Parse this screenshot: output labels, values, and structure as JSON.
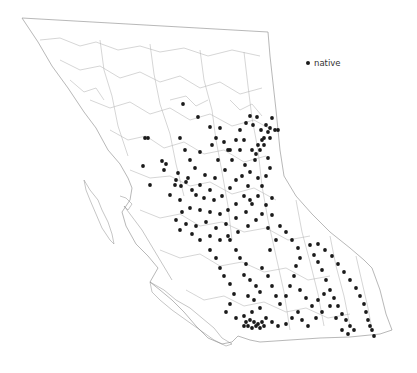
{
  "map": {
    "region": "British Columbia",
    "background": "#ffffff",
    "point_color": "#1a1a1a",
    "outline_color": "#9a9a9a",
    "river_color": "#b4b4b4"
  },
  "legend": {
    "items": [
      {
        "label": "native",
        "symbol": "filled-circle",
        "color": "#1a1a1a"
      }
    ]
  },
  "occurrences": {
    "category": "native",
    "points": [
      [
        183,
        104
      ],
      [
        198,
        117
      ],
      [
        210,
        127
      ],
      [
        180,
        138
      ],
      [
        145,
        138
      ],
      [
        148,
        138
      ],
      [
        228,
        150
      ],
      [
        143,
        166
      ],
      [
        162,
        161
      ],
      [
        164,
        170
      ],
      [
        166,
        164
      ],
      [
        150,
        185
      ],
      [
        178,
        173
      ],
      [
        185,
        150
      ],
      [
        190,
        160
      ],
      [
        195,
        168
      ],
      [
        200,
        152
      ],
      [
        212,
        145
      ],
      [
        218,
        160
      ],
      [
        205,
        175
      ],
      [
        188,
        178
      ],
      [
        175,
        185
      ],
      [
        170,
        195
      ],
      [
        180,
        200
      ],
      [
        192,
        190
      ],
      [
        200,
        185
      ],
      [
        210,
        190
      ],
      [
        215,
        178
      ],
      [
        225,
        170
      ],
      [
        232,
        160
      ],
      [
        240,
        150
      ],
      [
        245,
        165
      ],
      [
        250,
        172
      ],
      [
        255,
        160
      ],
      [
        260,
        150
      ],
      [
        262,
        140
      ],
      [
        268,
        132
      ],
      [
        270,
        128
      ],
      [
        275,
        130
      ],
      [
        264,
        138
      ],
      [
        258,
        145
      ],
      [
        252,
        150
      ],
      [
        176,
        180
      ],
      [
        181,
        186
      ],
      [
        186,
        182
      ],
      [
        196,
        195
      ],
      [
        204,
        198
      ],
      [
        214,
        200
      ],
      [
        222,
        196
      ],
      [
        230,
        188
      ],
      [
        236,
        180
      ],
      [
        242,
        176
      ],
      [
        248,
        186
      ],
      [
        244,
        196
      ],
      [
        236,
        204
      ],
      [
        228,
        210
      ],
      [
        220,
        214
      ],
      [
        210,
        212
      ],
      [
        200,
        210
      ],
      [
        190,
        208
      ],
      [
        182,
        212
      ],
      [
        176,
        220
      ],
      [
        186,
        224
      ],
      [
        196,
        226
      ],
      [
        206,
        222
      ],
      [
        216,
        228
      ],
      [
        226,
        224
      ],
      [
        236,
        218
      ],
      [
        246,
        212
      ],
      [
        252,
        204
      ],
      [
        258,
        196
      ],
      [
        262,
        186
      ],
      [
        266,
        176
      ],
      [
        270,
        168
      ],
      [
        268,
        158
      ],
      [
        258,
        178
      ],
      [
        250,
        200
      ],
      [
        180,
        230
      ],
      [
        192,
        234
      ],
      [
        200,
        240
      ],
      [
        210,
        236
      ],
      [
        220,
        240
      ],
      [
        228,
        236
      ],
      [
        238,
        232
      ],
      [
        248,
        226
      ],
      [
        256,
        220
      ],
      [
        262,
        214
      ],
      [
        266,
        205
      ],
      [
        272,
        198
      ],
      [
        272,
        215
      ],
      [
        268,
        228
      ],
      [
        246,
        123
      ],
      [
        250,
        116
      ],
      [
        253,
        125
      ],
      [
        257,
        117
      ],
      [
        261,
        130
      ],
      [
        266,
        125
      ],
      [
        272,
        118
      ],
      [
        278,
        130
      ],
      [
        270,
        138
      ],
      [
        264,
        145
      ],
      [
        256,
        154
      ],
      [
        240,
        130
      ],
      [
        244,
        140
      ],
      [
        236,
        140
      ],
      [
        230,
        150
      ],
      [
        224,
        142
      ],
      [
        216,
        138
      ],
      [
        220,
        128
      ],
      [
        230,
        240
      ],
      [
        236,
        250
      ],
      [
        240,
        258
      ],
      [
        246,
        264
      ],
      [
        244,
        275
      ],
      [
        250,
        280
      ],
      [
        256,
        286
      ],
      [
        260,
        292
      ],
      [
        254,
        300
      ],
      [
        248,
        296
      ],
      [
        262,
        268
      ],
      [
        268,
        276
      ],
      [
        272,
        286
      ],
      [
        276,
        296
      ],
      [
        280,
        304
      ],
      [
        286,
        296
      ],
      [
        290,
        286
      ],
      [
        294,
        276
      ],
      [
        296,
        266
      ],
      [
        300,
        258
      ],
      [
        298,
        248
      ],
      [
        292,
        240
      ],
      [
        286,
        232
      ],
      [
        280,
        226
      ],
      [
        276,
        240
      ],
      [
        270,
        250
      ],
      [
        210,
        250
      ],
      [
        216,
        258
      ],
      [
        220,
        268
      ],
      [
        224,
        276
      ],
      [
        230,
        284
      ],
      [
        234,
        294
      ],
      [
        230,
        304
      ],
      [
        226,
        312
      ],
      [
        236,
        318
      ],
      [
        244,
        316
      ],
      [
        252,
        312
      ],
      [
        260,
        308
      ],
      [
        266,
        318
      ],
      [
        272,
        322
      ],
      [
        278,
        326
      ],
      [
        286,
        324
      ],
      [
        292,
        318
      ],
      [
        298,
        312
      ],
      [
        302,
        320
      ],
      [
        308,
        326
      ],
      [
        316,
        318
      ],
      [
        322,
        312
      ],
      [
        310,
        245
      ],
      [
        314,
        255
      ],
      [
        318,
        262
      ],
      [
        322,
        270
      ],
      [
        326,
        280
      ],
      [
        330,
        290
      ],
      [
        334,
        298
      ],
      [
        338,
        306
      ],
      [
        342,
        314
      ],
      [
        346,
        320
      ],
      [
        350,
        326
      ],
      [
        318,
        244
      ],
      [
        325,
        250
      ],
      [
        332,
        256
      ],
      [
        338,
        264
      ],
      [
        344,
        272
      ],
      [
        350,
        280
      ],
      [
        356,
        288
      ],
      [
        360,
        296
      ],
      [
        364,
        304
      ],
      [
        366,
        312
      ],
      [
        368,
        320
      ],
      [
        370,
        326
      ],
      [
        372,
        330
      ],
      [
        374,
        336
      ],
      [
        300,
        290
      ],
      [
        306,
        298
      ],
      [
        312,
        306
      ],
      [
        318,
        300
      ],
      [
        324,
        294
      ],
      [
        330,
        306
      ],
      [
        336,
        318
      ],
      [
        342,
        330
      ],
      [
        348,
        334
      ],
      [
        354,
        330
      ],
      [
        246,
        322
      ],
      [
        250,
        320
      ],
      [
        254,
        322
      ],
      [
        258,
        324
      ],
      [
        262,
        322
      ],
      [
        264,
        326
      ],
      [
        248,
        326
      ],
      [
        252,
        328
      ],
      [
        256,
        326
      ],
      [
        260,
        328
      ],
      [
        244,
        326
      ]
    ]
  }
}
